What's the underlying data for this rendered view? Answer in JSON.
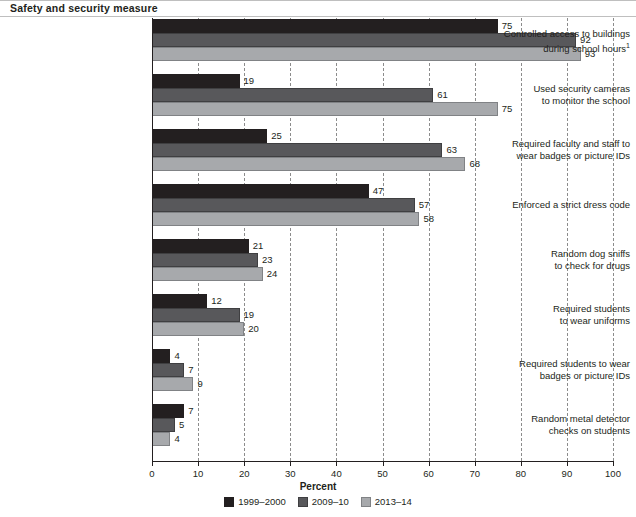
{
  "header": {
    "title": "Safety and security measure"
  },
  "chart_data": {
    "type": "bar",
    "orientation": "horizontal",
    "title": "Safety and security measure",
    "xlabel": "Percent",
    "ylabel": "",
    "xlim": [
      0,
      100
    ],
    "xticks": [
      "0",
      "10",
      "20",
      "30",
      "40",
      "50",
      "60",
      "70",
      "80",
      "90",
      "100"
    ],
    "grid": "vertical-dashed",
    "legend_position": "bottom",
    "categories": [
      "Controlled access to buildings during school hours",
      "Used security cameras to monitor the school",
      "Required faculty and staff to wear badges or picture IDs",
      "Enforced a strict dress code",
      "Random dog sniffs to check for drugs",
      "Required students to wear uniforms",
      "Required students to wear badges or picture IDs",
      "Random metal detector checks on students"
    ],
    "category_lines": [
      [
        "Controlled access to buildings",
        "during school hours"
      ],
      [
        "Used security cameras",
        "to monitor the school"
      ],
      [
        "Required faculty and staff to",
        "wear badges or picture IDs"
      ],
      [
        "Enforced a strict dress code"
      ],
      [
        "Random dog sniffs",
        "to check for drugs"
      ],
      [
        "Required students",
        "to wear uniforms"
      ],
      [
        "Required students to wear",
        "badges or picture IDs"
      ],
      [
        "Random metal detector",
        "checks on students"
      ]
    ],
    "category_footnotes": [
      "1",
      "",
      "",
      "",
      "",
      "",
      "",
      ""
    ],
    "series": [
      {
        "name": "1999–2000",
        "color": "#231f20",
        "values": [
          75,
          19,
          25,
          47,
          21,
          12,
          4,
          7
        ]
      },
      {
        "name": "2009–10",
        "color": "#58585b",
        "values": [
          92,
          61,
          63,
          57,
          23,
          19,
          7,
          5
        ]
      },
      {
        "name": "2013–14",
        "color": "#a7a9ac",
        "values": [
          93,
          75,
          68,
          58,
          24,
          20,
          9,
          4
        ]
      }
    ]
  }
}
